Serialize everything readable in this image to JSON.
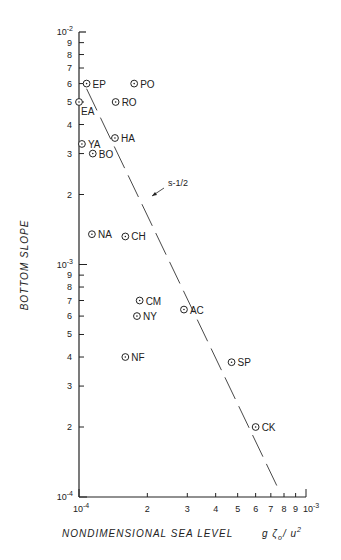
{
  "chart_data": {
    "type": "scatter",
    "title": "",
    "xlabel": "NONDIMENSIONAL   SEA  LEVEL",
    "xlabel_formula": "g ζ0 / u*²",
    "ylabel": "BOTTOM  SLOPE",
    "xscale": "log",
    "yscale": "log",
    "xlim": [
      0.0001,
      0.001
    ],
    "ylim": [
      0.0001,
      0.01
    ],
    "x_tick_labels": [
      "10^-4",
      "2",
      "3",
      "4",
      "5",
      "6",
      "7",
      "8",
      "9",
      "10^-3"
    ],
    "y_tick_labels": [
      "10^-4",
      "2",
      "3",
      "4",
      "5",
      "6",
      "7",
      "8",
      "9",
      "10^-3",
      "2",
      "3",
      "4",
      "5",
      "6",
      "7",
      "8",
      "9",
      "10^-2"
    ],
    "grid": false,
    "points": [
      {
        "label": "EP",
        "x": 0.000108,
        "y": 0.006
      },
      {
        "label": "PO",
        "x": 0.000175,
        "y": 0.006
      },
      {
        "label": "EA",
        "x": 0.0001,
        "y": 0.005
      },
      {
        "label": "RO",
        "x": 0.000145,
        "y": 0.005
      },
      {
        "label": "HA",
        "x": 0.000144,
        "y": 0.0035
      },
      {
        "label": "YA",
        "x": 0.000103,
        "y": 0.0033
      },
      {
        "label": "BO",
        "x": 0.000115,
        "y": 0.003
      },
      {
        "label": "NA",
        "x": 0.000114,
        "y": 0.00135
      },
      {
        "label": "CH",
        "x": 0.00016,
        "y": 0.00132
      },
      {
        "label": "CM",
        "x": 0.000185,
        "y": 0.0007
      },
      {
        "label": "NY",
        "x": 0.00018,
        "y": 0.0006
      },
      {
        "label": "AC",
        "x": 0.00029,
        "y": 0.00064
      },
      {
        "label": "NF",
        "x": 0.00016,
        "y": 0.0004
      },
      {
        "label": "SP",
        "x": 0.00047,
        "y": 0.00038
      },
      {
        "label": "CK",
        "x": 0.0006,
        "y": 0.0002
      }
    ],
    "fit_line": {
      "label": "s^-1/2",
      "style": "dashed",
      "x": [
        0.000108,
        0.00075
      ],
      "y": [
        0.0057,
        0.00011
      ]
    }
  }
}
